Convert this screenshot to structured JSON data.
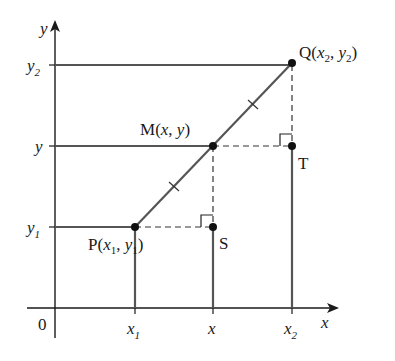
{
  "figure": {
    "type": "coordinate-geometry-diagram",
    "axes": {
      "x_label": "x",
      "y_label": "y",
      "origin_label": "0"
    },
    "x_ticks": [
      {
        "label": "x",
        "sub": "1"
      },
      {
        "label": "x",
        "sub": ""
      },
      {
        "label": "x",
        "sub": "2"
      }
    ],
    "y_ticks": [
      {
        "label": "y",
        "sub": "2"
      },
      {
        "label": "y",
        "sub": ""
      },
      {
        "label": "y",
        "sub": "1"
      }
    ],
    "points": {
      "P": {
        "name": "P",
        "coords": "(x1, y1)"
      },
      "M": {
        "name": "M",
        "coords": "(x, y)"
      },
      "Q": {
        "name": "Q",
        "coords": "(x2, y2)"
      },
      "S": {
        "name": "S"
      },
      "T": {
        "name": "T"
      }
    },
    "colors": {
      "line": "#555555",
      "axis": "#1a1a1a",
      "point": "#111111"
    }
  }
}
